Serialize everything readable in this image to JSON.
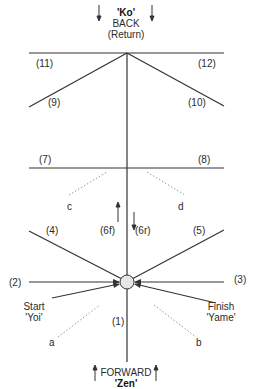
{
  "top": {
    "term": "'Ko'",
    "line1": "BACK",
    "line2": "(Return)"
  },
  "bottom": {
    "line1": "FORWARD",
    "term": "'Zen'"
  },
  "start": {
    "line1": "Start",
    "line2": "'Yoi'"
  },
  "finish": {
    "line1": "Finish",
    "line2": "'Yame'"
  },
  "labels": {
    "l1": "(1)",
    "l2": "(2)",
    "l3": "(3)",
    "l4": "(4)",
    "l5": "(5)",
    "l6f": "(6f)",
    "l6r": "(6r)",
    "l7": "(7)",
    "l8": "(8)",
    "l9": "(9)",
    "l10": "(10)",
    "l11": "(11)",
    "l12": "(12)",
    "a": "a",
    "b": "b",
    "c": "c",
    "d": "d"
  },
  "colors": {
    "line": "#333333",
    "dotted": "#999999",
    "circle_fill": "#e6e6e6"
  }
}
